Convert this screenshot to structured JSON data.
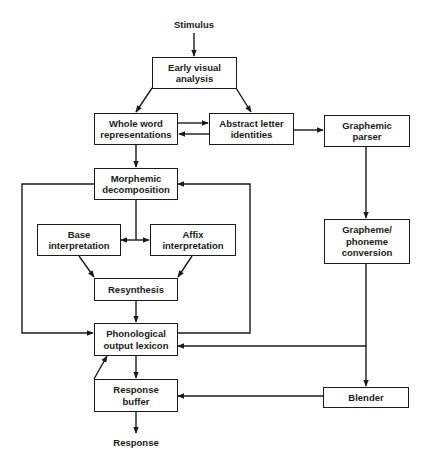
{
  "diagram": {
    "input_label": "Stimulus",
    "output_label": "Response",
    "nodes": {
      "early_visual": "Early visual\nanalysis",
      "whole_word": "Whole word\nrepresentations",
      "abstract_letter": "Abstract letter\nidentities",
      "graphemic_parser": "Graphemic\nparser",
      "morphemic": "Morphemic\ndecomposition",
      "base_interp": "Base\ninterpretation",
      "affix_interp": "Affix\ninterpretation",
      "resynthesis": "Resynthesis",
      "phono_lexicon": "Phonological\noutput lexicon",
      "grapheme_phoneme": "Grapheme/\nphoneme\nconversion",
      "response_buffer": "Response\nbuffer",
      "blender": "Blender"
    },
    "edges": [
      {
        "from": "Stimulus",
        "to": "Early visual analysis"
      },
      {
        "from": "Early visual analysis",
        "to": "Whole word representations"
      },
      {
        "from": "Early visual analysis",
        "to": "Abstract letter identities"
      },
      {
        "from": "Whole word representations",
        "to": "Abstract letter identities"
      },
      {
        "from": "Abstract letter identities",
        "to": "Whole word representations"
      },
      {
        "from": "Abstract letter identities",
        "to": "Graphemic parser"
      },
      {
        "from": "Whole word representations",
        "to": "Morphemic decomposition"
      },
      {
        "from": "Morphemic decomposition",
        "to": "Base interpretation"
      },
      {
        "from": "Morphemic decomposition",
        "to": "Affix interpretation"
      },
      {
        "from": "Morphemic decomposition",
        "to": "Phonological output lexicon"
      },
      {
        "from": "Phonological output lexicon",
        "to": "Morphemic decomposition"
      },
      {
        "from": "Base interpretation",
        "to": "Resynthesis"
      },
      {
        "from": "Affix interpretation",
        "to": "Resynthesis"
      },
      {
        "from": "Resynthesis",
        "to": "Phonological output lexicon"
      },
      {
        "from": "Graphemic parser",
        "to": "Grapheme/phoneme conversion"
      },
      {
        "from": "Grapheme/phoneme conversion",
        "to": "Phonological output lexicon"
      },
      {
        "from": "Grapheme/phoneme conversion",
        "to": "Blender"
      },
      {
        "from": "Phonological output lexicon",
        "to": "Response buffer"
      },
      {
        "from": "Response buffer",
        "to": "Phonological output lexicon"
      },
      {
        "from": "Blender",
        "to": "Response buffer"
      },
      {
        "from": "Response buffer",
        "to": "Response"
      }
    ],
    "colors": {
      "ink": "#1a1a1a",
      "background": "#ffffff"
    }
  }
}
